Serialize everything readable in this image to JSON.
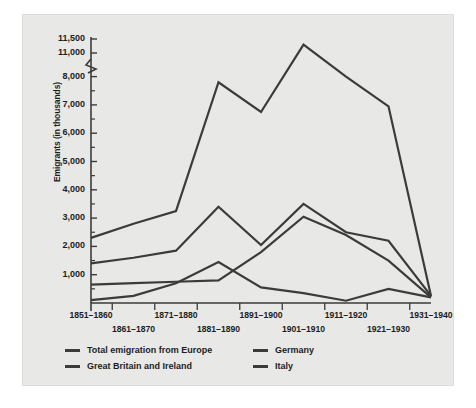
{
  "figure": {
    "background_color": "#e8e8e6",
    "line_color": "#3b3b3b",
    "text_color": "#1d1d1d"
  },
  "chart_data": {
    "type": "line",
    "title": "",
    "xlabel": "",
    "ylabel": "Emigrants (in thousands)",
    "categories": [
      "1851–1860",
      "1861–1870",
      "1871–1880",
      "1881–1890",
      "1891–1900",
      "1901–1910",
      "1911–1920",
      "1921–1930",
      "1931–1940"
    ],
    "ytick_labels": [
      "1,000",
      "2,000",
      "3,000",
      "4,000",
      "5,000",
      "6,000",
      "7,000",
      "8,000",
      "11,000",
      "11,500"
    ],
    "ytick_values": [
      1000,
      2000,
      3000,
      4000,
      5000,
      6000,
      7000,
      8000,
      11000,
      11500
    ],
    "ylim": [
      0,
      11500
    ],
    "axis_break": {
      "present": true,
      "between": [
        8000,
        11000
      ]
    },
    "grid": false,
    "legend_position": "below-axes",
    "series": [
      {
        "name": "Total emigration from Europe",
        "color": "#3b3b3b",
        "values": [
          2300,
          2800,
          3250,
          7800,
          6750,
          11300,
          8000,
          6950,
          250
        ]
      },
      {
        "name": "Great Britain and Ireland",
        "color": "#3b3b3b",
        "values": [
          1400,
          1600,
          1850,
          3400,
          2050,
          3500,
          2500,
          2200,
          250
        ]
      },
      {
        "name": "Germany",
        "color": "#3b3b3b",
        "values": [
          100,
          250,
          700,
          1450,
          550,
          350,
          80,
          500,
          200
        ]
      },
      {
        "name": "Italy",
        "color": "#3b3b3b",
        "values": [
          650,
          700,
          750,
          800,
          1800,
          3050,
          2400,
          1500,
          200
        ]
      }
    ]
  }
}
